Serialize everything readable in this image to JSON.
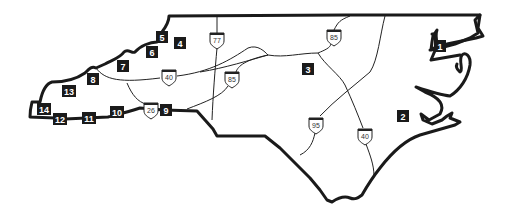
{
  "map": {
    "region": "North Carolina",
    "colors": {
      "outline": "#1a1a1a",
      "roads": "#222222",
      "marker_bg": "#1a1a1a",
      "marker_text": "#ffffff",
      "background": "#ffffff"
    },
    "markers": [
      {
        "id": "1",
        "label": "1",
        "x": 440,
        "y": 46
      },
      {
        "id": "2",
        "label": "2",
        "x": 403,
        "y": 116
      },
      {
        "id": "3",
        "label": "3",
        "x": 308,
        "y": 69
      },
      {
        "id": "4",
        "label": "4",
        "x": 180,
        "y": 43
      },
      {
        "id": "5",
        "label": "5",
        "x": 162,
        "y": 37
      },
      {
        "id": "6",
        "label": "6",
        "x": 152,
        "y": 52
      },
      {
        "id": "7",
        "label": "7",
        "x": 123,
        "y": 66
      },
      {
        "id": "8",
        "label": "8",
        "x": 93,
        "y": 79
      },
      {
        "id": "9",
        "label": "9",
        "x": 166,
        "y": 110
      },
      {
        "id": "10",
        "label": "10",
        "x": 117,
        "y": 112
      },
      {
        "id": "11",
        "label": "11",
        "x": 89,
        "y": 118
      },
      {
        "id": "12",
        "label": "12",
        "x": 60,
        "y": 119
      },
      {
        "id": "13",
        "label": "13",
        "x": 69,
        "y": 91
      },
      {
        "id": "14",
        "label": "14",
        "x": 44,
        "y": 109
      }
    ],
    "interstates": [
      {
        "label": "77",
        "x": 217,
        "y": 40
      },
      {
        "label": "85",
        "x": 334,
        "y": 37
      },
      {
        "label": "40",
        "x": 169,
        "y": 77
      },
      {
        "label": "85",
        "x": 232,
        "y": 79
      },
      {
        "label": "26",
        "x": 151,
        "y": 110
      },
      {
        "label": "95",
        "x": 316,
        "y": 125
      },
      {
        "label": "40",
        "x": 365,
        "y": 136
      }
    ]
  }
}
